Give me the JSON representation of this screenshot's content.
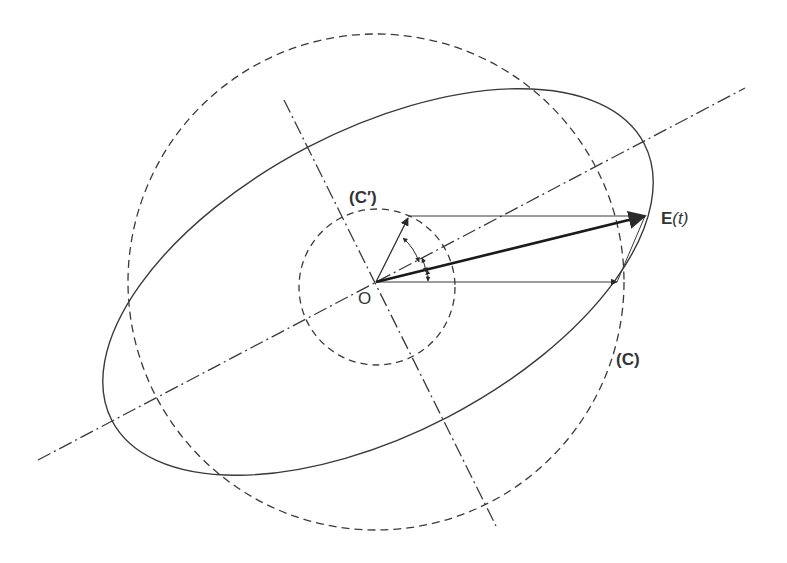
{
  "diagram": {
    "labels": {
      "origin": "O",
      "small_circle": "(C′)",
      "large_circle": "(C)",
      "field_vector_bold": "E",
      "field_vector_rest": "(t)"
    },
    "colors": {
      "stroke": "#3a3a3a",
      "background": "#ffffff"
    },
    "geometry": {
      "origin": [
        376,
        282
      ],
      "large_circle_radius": 248,
      "small_circle_radius": 78,
      "ellipse": {
        "cx": 378,
        "cy": 282,
        "rx": 300,
        "ry": 155,
        "rotation_deg": -27.5
      },
      "major_axis": [
        [
          38,
          460
        ],
        [
          745,
          88
        ]
      ],
      "minor_axis": [
        [
          284,
          100
        ],
        [
          496,
          526
        ]
      ],
      "e_vector_tip": [
        645,
        216
      ],
      "x_vector_tip": [
        617,
        282
      ],
      "y_vector_tip": [
        408,
        218
      ]
    }
  }
}
